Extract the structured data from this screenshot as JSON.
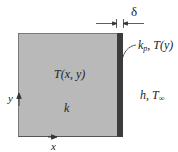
{
  "diagram": {
    "type": "heat-conduction-schematic",
    "block": {
      "temperature_label": "T(x, y)",
      "conductivity_label": "k",
      "fill_color": "#b9b9b9"
    },
    "plate": {
      "conductivity_label_base": "k",
      "conductivity_label_sub": "p",
      "temperature_label": ", T(y)",
      "thickness_label": "δ",
      "fill_color": "#3c3c3c"
    },
    "convection": {
      "label_h": "h, T",
      "label_sub": "∞"
    },
    "axes": {
      "x_label": "x",
      "y_label": "y"
    }
  }
}
